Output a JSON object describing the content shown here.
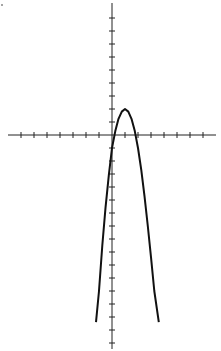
{
  "chart_data": {
    "type": "line",
    "title": "",
    "xlabel": "",
    "ylabel": "",
    "grid": false,
    "legend": null,
    "equation": "y = -3(x - 1)^2 + 2 (approx.)",
    "vertex": [
      1,
      2
    ],
    "x_ticks": [
      -7,
      -6,
      -5,
      -4,
      -3,
      -2,
      -1,
      1,
      2,
      3,
      4,
      5,
      6,
      7
    ],
    "y_ticks": [
      -16,
      -15,
      -14,
      -13,
      -12,
      -11,
      -10,
      -9,
      -8,
      -7,
      -6,
      -5,
      -4,
      -3,
      -2,
      -1,
      1,
      2,
      3,
      4,
      5,
      6,
      7,
      8,
      9
    ],
    "xlim": [
      -8,
      8
    ],
    "ylim": [
      -16,
      10
    ],
    "series": [
      {
        "name": "parabola",
        "color": "#111111",
        "x": [
          -1.23,
          -1.0,
          -0.75,
          -0.5,
          -0.25,
          0.0,
          0.25,
          0.5,
          0.75,
          1.0,
          1.25,
          1.5,
          1.75,
          2.0,
          2.25,
          2.5,
          2.75,
          3.0,
          3.25,
          3.6
        ],
        "y": [
          -14.4,
          -12.0,
          -8.5,
          -5.6,
          -3.1,
          -1.0,
          0.3,
          1.25,
          1.8,
          2.0,
          1.8,
          1.25,
          0.3,
          -1.0,
          -2.7,
          -4.7,
          -7.0,
          -9.4,
          -12.0,
          -14.4
        ]
      }
    ],
    "pixel_mapping": {
      "origin_px": [
        112,
        135
      ],
      "unit_px": 13
    }
  }
}
